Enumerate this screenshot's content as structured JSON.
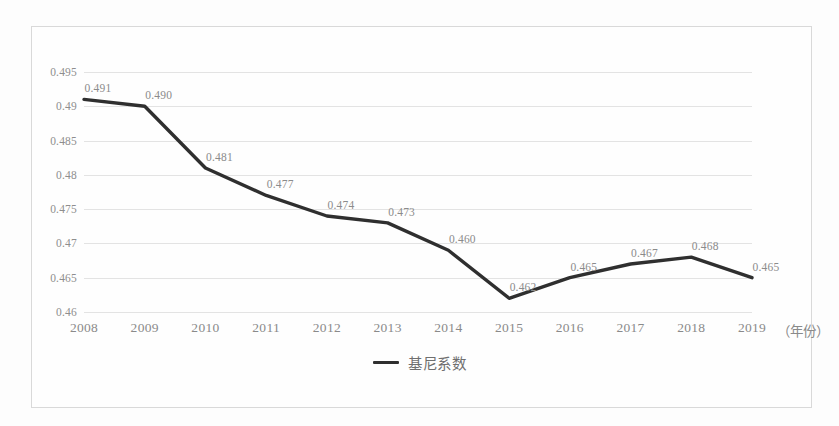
{
  "chart_data": {
    "type": "line",
    "title": "",
    "xlabel": "（年份）",
    "ylabel": "",
    "categories": [
      "2008",
      "2009",
      "2010",
      "2011",
      "2012",
      "2013",
      "2014",
      "2015",
      "2016",
      "2017",
      "2018",
      "2019"
    ],
    "series": [
      {
        "name": "基尼系数",
        "values": [
          0.491,
          0.49,
          0.481,
          0.477,
          0.474,
          0.473,
          0.469,
          0.462,
          0.465,
          0.467,
          0.468,
          0.465
        ],
        "color": "#2f2f2f"
      }
    ],
    "point_labels": [
      "0.491",
      "0.490",
      "0.481",
      "0.477",
      "0.474",
      "0.473",
      "0.460",
      "0.462",
      "0.465",
      "0.467",
      "0.468",
      "0.465"
    ],
    "ylim": [
      0.46,
      0.495
    ],
    "ytick_labels": [
      "0.495",
      "0.49",
      "0.485",
      "0.48",
      "0.475",
      "0.47",
      "0.465",
      "0.46"
    ],
    "ytick_values": [
      0.495,
      0.49,
      0.485,
      0.48,
      0.475,
      0.47,
      0.465,
      0.46
    ],
    "grid": true,
    "legend_position": "bottom",
    "legend_entries": [
      "基尼系数"
    ]
  },
  "legend": {
    "label": "基尼系数"
  },
  "axis": {
    "x_unit": "（年份）"
  }
}
